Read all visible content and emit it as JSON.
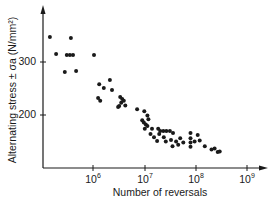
{
  "chart_data": {
    "type": "scatter",
    "title": "",
    "xlabel": "Number of reversals",
    "ylabel": "Alternating stress ± σa (N/mm²)",
    "x_scale": "log",
    "x_ticks": [
      {
        "label_base": "10",
        "label_exp": "6",
        "value": 1000000
      },
      {
        "label_base": "10",
        "label_exp": "7",
        "value": 10000000
      },
      {
        "label_base": "10",
        "label_exp": "8",
        "value": 100000000
      },
      {
        "label_base": "10",
        "label_exp": "9",
        "value": 1000000000
      }
    ],
    "y_ticks": [
      {
        "label": "300",
        "value": 300
      },
      {
        "label": "200",
        "value": 200
      }
    ],
    "xlim_log10": [
      4.9,
      9.5
    ],
    "ylim": [
      100,
      390
    ],
    "grid": false,
    "legend": null,
    "series": [
      {
        "name": "fatigue data",
        "points_log10N_stress": [
          [
            5.16,
            347
          ],
          [
            5.57,
            345
          ],
          [
            5.28,
            315
          ],
          [
            5.49,
            313
          ],
          [
            5.55,
            313
          ],
          [
            5.61,
            313
          ],
          [
            5.45,
            281
          ],
          [
            5.67,
            283
          ],
          [
            6.02,
            313
          ],
          [
            6.12,
            258
          ],
          [
            6.21,
            251
          ],
          [
            6.1,
            232
          ],
          [
            6.14,
            227
          ],
          [
            6.33,
            266
          ],
          [
            6.37,
            247
          ],
          [
            6.53,
            234
          ],
          [
            6.57,
            230
          ],
          [
            6.55,
            223
          ],
          [
            6.51,
            217
          ],
          [
            6.63,
            218
          ],
          [
            6.6,
            227
          ],
          [
            6.49,
            215
          ],
          [
            6.86,
            211
          ],
          [
            7.0,
            207
          ],
          [
            7.06,
            199
          ],
          [
            6.96,
            190
          ],
          [
            6.99,
            186
          ],
          [
            7.03,
            182
          ],
          [
            7.06,
            179
          ],
          [
            7.01,
            174
          ],
          [
            7.08,
            192
          ],
          [
            7.12,
            164
          ],
          [
            7.19,
            158
          ],
          [
            7.15,
            174
          ],
          [
            7.27,
            174
          ],
          [
            7.31,
            170
          ],
          [
            7.29,
            164
          ],
          [
            7.37,
            170
          ],
          [
            7.43,
            170
          ],
          [
            7.5,
            170
          ],
          [
            7.56,
            166
          ],
          [
            7.25,
            151
          ],
          [
            7.38,
            158
          ],
          [
            7.42,
            150
          ],
          [
            7.52,
            153
          ],
          [
            7.55,
            141
          ],
          [
            7.62,
            150
          ],
          [
            7.66,
            144
          ],
          [
            7.7,
            156
          ],
          [
            7.76,
            148
          ],
          [
            7.9,
            166
          ],
          [
            7.9,
            156
          ],
          [
            7.9,
            148
          ],
          [
            7.9,
            140
          ],
          [
            7.98,
            150
          ],
          [
            8.04,
            162
          ],
          [
            8.08,
            152
          ],
          [
            8.18,
            141
          ],
          [
            8.31,
            135
          ],
          [
            8.37,
            137
          ],
          [
            8.43,
            130
          ],
          [
            8.47,
            131
          ]
        ]
      }
    ]
  },
  "axes": {
    "x_label": "Number of reversals",
    "y_label": "Alternating stress ± σa (N/mm²)",
    "y_tick_300": "300",
    "y_tick_200": "200",
    "x_tick_base": "10",
    "x_tick_exp_6": "6",
    "x_tick_exp_7": "7",
    "x_tick_exp_8": "8",
    "x_tick_exp_9": "9"
  },
  "colors": {
    "ink": "#1a1a1a",
    "background": "#ffffff"
  }
}
